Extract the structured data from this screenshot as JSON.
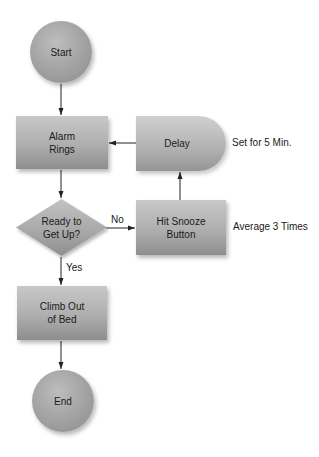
{
  "diagram": {
    "type": "flowchart",
    "nodes": {
      "start": {
        "label": "Start",
        "shape": "circle"
      },
      "alarm": {
        "label_line1": "Alarm",
        "label_line2": "Rings",
        "shape": "process"
      },
      "decision": {
        "label_line1": "Ready to",
        "label_line2": "Get Up?",
        "shape": "decision"
      },
      "snooze": {
        "label_line1": "Hit Snooze",
        "label_line2": "Button",
        "shape": "process"
      },
      "delay": {
        "label": "Delay",
        "shape": "delay"
      },
      "climb": {
        "label_line1": "Climb Out",
        "label_line2": "of Bed",
        "shape": "process"
      },
      "end": {
        "label": "End",
        "shape": "circle"
      }
    },
    "edges": [
      {
        "from": "start",
        "to": "alarm",
        "label": ""
      },
      {
        "from": "alarm",
        "to": "decision",
        "label": ""
      },
      {
        "from": "decision",
        "to": "snooze",
        "label": "No"
      },
      {
        "from": "snooze",
        "to": "delay",
        "label": ""
      },
      {
        "from": "delay",
        "to": "alarm",
        "label": ""
      },
      {
        "from": "decision",
        "to": "climb",
        "label": "Yes"
      },
      {
        "from": "climb",
        "to": "end",
        "label": ""
      }
    ],
    "edge_labels": {
      "no": "No",
      "yes": "Yes"
    },
    "annotations": {
      "delay_note": "Set for 5 Min.",
      "snooze_note": "Average 3 Times"
    },
    "colors": {
      "node_fill": "#b0b0b0",
      "edge": "#222222",
      "background": "#ffffff"
    }
  }
}
